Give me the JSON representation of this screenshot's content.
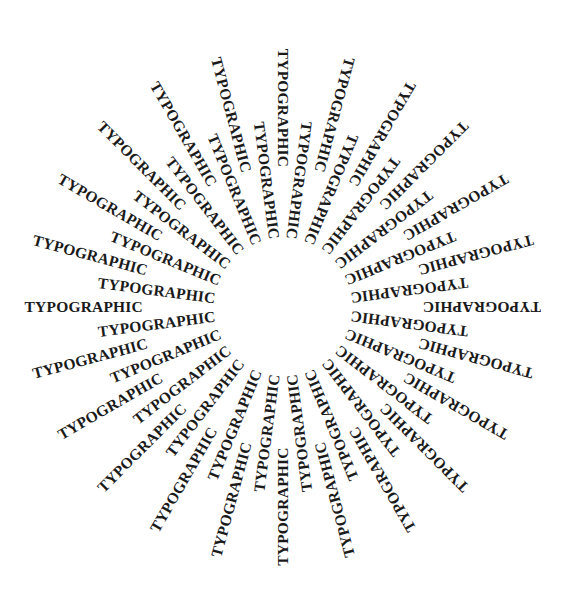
{
  "artwork": {
    "word": "TYPOGRAPHIC",
    "ray_count": 48,
    "center": [
      283,
      307
    ],
    "inner_radius": 68,
    "outer_radius": 140,
    "start_angle_deg": -90,
    "text_color": "#1a1a1a",
    "background": "#ffffff"
  }
}
